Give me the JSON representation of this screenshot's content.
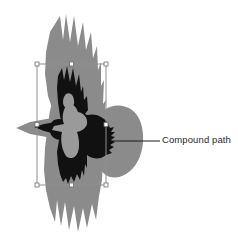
{
  "scene": {
    "type": "vector-illustration-callout",
    "width": 238,
    "height": 243,
    "background_color": "#ffffff",
    "description": "Bird of prey illustration in a vector editor with a selected compound path"
  },
  "annotation": {
    "label": "Compound path",
    "label_color": "#2b2b2b",
    "label_font_size_px": 9.5,
    "label_position": {
      "x": 162,
      "y": 134
    },
    "leader_line": {
      "color": "#1a1a1a",
      "thickness_px": 1.2,
      "x1": 112,
      "y1": 141,
      "x2": 160,
      "y2": 141
    }
  },
  "artwork": {
    "background_shape": {
      "name": "gray-bird-silhouette",
      "fill": "#8b8b8b",
      "description": "Large light-gray hawk silhouette with spread wings and fanned feather tips"
    },
    "selected_shape": {
      "name": "black-compound-path",
      "fill": "#111111",
      "description": "Black compound path forming the hawk body, head and serrated wing feathers"
    },
    "body_highlight": {
      "name": "body-highlight",
      "fill": "#9a9a9a",
      "description": "Interior counter shape of the compound path revealing the gray below"
    }
  },
  "selection": {
    "name": "selection-bounding-box",
    "stroke_color": "#8f8f8f",
    "stroke_width_px": 1,
    "bounds": {
      "left": 37,
      "top": 64,
      "right": 106,
      "bottom": 185
    },
    "handle": {
      "fill": "#ffffff",
      "stroke": "#6f6f6f",
      "size_px": 4
    },
    "handles": [
      {
        "name": "handle-top-left",
        "x": 37,
        "y": 64
      },
      {
        "name": "handle-top-center",
        "x": 71.5,
        "y": 64
      },
      {
        "name": "handle-top-right",
        "x": 106,
        "y": 64
      },
      {
        "name": "handle-middle-left",
        "x": 37,
        "y": 124.5
      },
      {
        "name": "handle-middle-right",
        "x": 106,
        "y": 124.5
      },
      {
        "name": "handle-bottom-left",
        "x": 37,
        "y": 185
      },
      {
        "name": "handle-bottom-center",
        "x": 71.5,
        "y": 185
      },
      {
        "name": "handle-bottom-right",
        "x": 106,
        "y": 185
      }
    ]
  }
}
